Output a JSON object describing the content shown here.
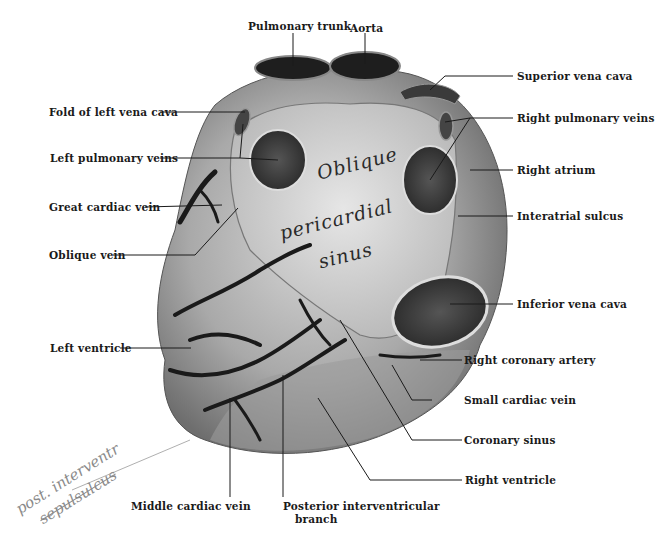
{
  "figure": {
    "background": "#ffffff",
    "ink_color": "#1a1a1a"
  },
  "region_text": {
    "line1": "Oblique",
    "line2": "pericardial",
    "line3": "sinus"
  },
  "labels": {
    "pulmonary_trunk": "Pulmonary trunk",
    "aorta": "Aorta",
    "superior_vena_cava": "Superior vena cava",
    "fold_left_vena_cava": "Fold of left vena cava",
    "right_pulmonary_veins": "Right pulmonary veins",
    "left_pulmonary_veins": "Left pulmonary veins",
    "right_atrium": "Right atrium",
    "great_cardiac_vein": "Great cardiac vein",
    "interatrial_sulcus": "Interatrial sulcus",
    "oblique_vein": "Oblique vein",
    "inferior_vena_cava": "Inferior vena cava",
    "left_ventricle": "Left ventricle",
    "right_coronary_artery": "Right coronary artery",
    "small_cardiac_vein": "Small cardiac vein",
    "coronary_sinus": "Coronary sinus",
    "right_ventricle": "Right ventricle",
    "middle_cardiac_vein": "Middle cardiac vein",
    "posterior_interventricular_line1": "Posterior interventricular",
    "posterior_interventricular_line2": "branch"
  },
  "handwritten_annotation": {
    "line1": "post. interventr",
    "line2": "sepulsulcus"
  }
}
